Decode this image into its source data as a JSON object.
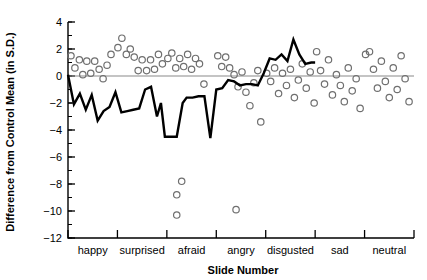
{
  "chart_data": {
    "type": "scatter",
    "title": "",
    "xlabel": "Slide Number",
    "ylabel": "Difference from Control Mean (in S.D.)",
    "ylim": [
      -12,
      4
    ],
    "xlim": [
      0,
      70
    ],
    "ytick_labels": [
      "4",
      "2",
      "0",
      "-2",
      "-4",
      "-6",
      "-8",
      "-10",
      "-12"
    ],
    "ytick_values": [
      4,
      2,
      0,
      -2,
      -4,
      -6,
      -8,
      -10,
      -12
    ],
    "yminor_step": 1,
    "grid": false,
    "legend": null,
    "zero_reference_line": 0,
    "categories": [
      "happy",
      "surprised",
      "afraid",
      "angry",
      "disgusted",
      "sad",
      "neutral"
    ],
    "category_boundaries": [
      0,
      10,
      20,
      30,
      40,
      50,
      60,
      70
    ],
    "series": [
      {
        "name": "patient scores (scatter)",
        "marker": "open-circle",
        "points": [
          [
            0.6,
            1.5
          ],
          [
            1.4,
            0.6
          ],
          [
            2.3,
            1.2
          ],
          [
            3.0,
            0.1
          ],
          [
            3.8,
            1.1
          ],
          [
            4.6,
            0.2
          ],
          [
            5.4,
            1.1
          ],
          [
            6.3,
            0.5
          ],
          [
            7.1,
            -0.2
          ],
          [
            7.9,
            0.8
          ],
          [
            8.7,
            1.6
          ],
          [
            10.1,
            2.1
          ],
          [
            10.9,
            2.8
          ],
          [
            11.8,
            1.6
          ],
          [
            12.6,
            2.0
          ],
          [
            13.4,
            1.4
          ],
          [
            14.2,
            0.4
          ],
          [
            15.0,
            1.2
          ],
          [
            15.9,
            0.4
          ],
          [
            16.7,
            1.2
          ],
          [
            17.5,
            0.5
          ],
          [
            18.3,
            1.6
          ],
          [
            19.1,
            0.9
          ],
          [
            20.2,
            1.3
          ],
          [
            21.0,
            1.7
          ],
          [
            21.8,
            0.6
          ],
          [
            22.6,
            1.3
          ],
          [
            23.4,
            0.7
          ],
          [
            24.2,
            1.6
          ],
          [
            25.0,
            0.5
          ],
          [
            25.8,
            1.3
          ],
          [
            26.6,
            0.9
          ],
          [
            23.0,
            -7.8
          ],
          [
            22.0,
            -8.8
          ],
          [
            22.0,
            -10.3
          ],
          [
            27.5,
            -0.6
          ],
          [
            30.3,
            1.5
          ],
          [
            31.1,
            0.7
          ],
          [
            31.9,
            1.4
          ],
          [
            32.7,
            0.6
          ],
          [
            33.6,
            0.1
          ],
          [
            34.4,
            -0.8
          ],
          [
            35.2,
            0.3
          ],
          [
            36.0,
            -1.2
          ],
          [
            36.8,
            -2.2
          ],
          [
            37.6,
            -0.5
          ],
          [
            38.4,
            0.4
          ],
          [
            39.0,
            -3.4
          ],
          [
            34.0,
            -9.9
          ],
          [
            40.2,
            0.2
          ],
          [
            41.0,
            -0.4
          ],
          [
            41.8,
            0.6
          ],
          [
            42.6,
            -1.3
          ],
          [
            43.4,
            0.2
          ],
          [
            44.2,
            -0.7
          ],
          [
            45.0,
            0.5
          ],
          [
            45.8,
            -1.6
          ],
          [
            46.6,
            -0.3
          ],
          [
            47.4,
            0.9
          ],
          [
            48.2,
            -0.9
          ],
          [
            49.0,
            0.3
          ],
          [
            49.8,
            -2.0
          ],
          [
            50.3,
            1.8
          ],
          [
            51.1,
            0.4
          ],
          [
            51.9,
            -0.6
          ],
          [
            52.7,
            1.2
          ],
          [
            53.5,
            -1.4
          ],
          [
            54.3,
            0.1
          ],
          [
            55.1,
            -0.7
          ],
          [
            55.9,
            -1.9
          ],
          [
            56.7,
            0.6
          ],
          [
            57.5,
            -1.1
          ],
          [
            58.3,
            -0.2
          ],
          [
            59.1,
            -2.4
          ],
          [
            60.2,
            1.6
          ],
          [
            61.0,
            1.8
          ],
          [
            61.8,
            0.5
          ],
          [
            62.6,
            -0.9
          ],
          [
            63.4,
            1.1
          ],
          [
            64.2,
            -0.4
          ],
          [
            65.0,
            -1.6
          ],
          [
            65.8,
            0.6
          ],
          [
            66.6,
            -1.0
          ],
          [
            67.4,
            1.5
          ],
          [
            68.2,
            -0.2
          ],
          [
            69.0,
            -1.9
          ]
        ]
      },
      {
        "name": "mean difference (line)",
        "marker": "none",
        "points": [
          [
            0.0,
            0.1
          ],
          [
            1.2,
            -2.1
          ],
          [
            2.4,
            -1.3
          ],
          [
            3.6,
            -2.5
          ],
          [
            4.8,
            -1.4
          ],
          [
            6.0,
            -3.3
          ],
          [
            7.2,
            -2.6
          ],
          [
            8.4,
            -2.3
          ],
          [
            9.6,
            -1.2
          ],
          [
            10.8,
            -2.7
          ],
          [
            12.0,
            -2.6
          ],
          [
            13.2,
            -2.5
          ],
          [
            14.4,
            -2.4
          ],
          [
            15.6,
            -1.0
          ],
          [
            16.8,
            -0.8
          ],
          [
            18.0,
            -3.0
          ],
          [
            18.8,
            -2.0
          ],
          [
            19.6,
            -4.5
          ],
          [
            20.8,
            -4.5
          ],
          [
            22.0,
            -4.5
          ],
          [
            23.2,
            -2.0
          ],
          [
            24.0,
            -1.6
          ],
          [
            25.2,
            -1.6
          ],
          [
            26.4,
            -1.5
          ],
          [
            27.6,
            -1.5
          ],
          [
            28.8,
            -4.6
          ],
          [
            30.0,
            -1.0
          ],
          [
            31.2,
            -0.9
          ],
          [
            32.4,
            -0.3
          ],
          [
            33.6,
            -0.4
          ],
          [
            34.8,
            -0.7
          ],
          [
            36.0,
            -0.6
          ],
          [
            37.2,
            -0.6
          ],
          [
            38.4,
            -0.7
          ],
          [
            39.6,
            0.2
          ],
          [
            40.8,
            1.3
          ],
          [
            42.0,
            1.2
          ],
          [
            43.2,
            1.6
          ],
          [
            44.4,
            1.1
          ],
          [
            45.6,
            2.7
          ],
          [
            46.8,
            1.6
          ],
          [
            48.0,
            0.9
          ],
          [
            49.2,
            1.0
          ],
          [
            50.0,
            1.0
          ]
        ]
      }
    ]
  }
}
